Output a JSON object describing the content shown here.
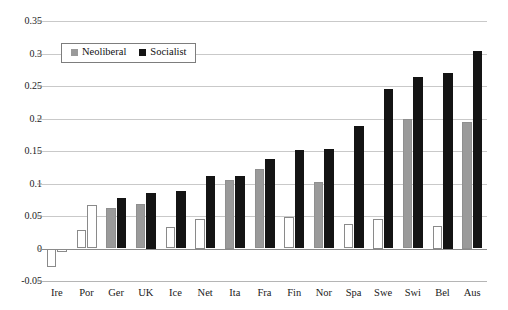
{
  "chart_data": {
    "type": "bar",
    "title": "",
    "xlabel": "",
    "ylabel": "",
    "ylim": [
      -0.05,
      0.35
    ],
    "ytick_values": [
      0.35,
      0.3,
      0.25,
      0.2,
      0.15,
      0.1,
      0.05,
      0,
      -0.05
    ],
    "ytick_labels": [
      "0.35",
      "0.3",
      "0.25",
      "0.2",
      "0.15",
      "0.1",
      "0.05",
      "0",
      "-0.05"
    ],
    "grid": true,
    "legend_position": "upper-left-inside",
    "categories": [
      "Ire",
      "Por",
      "Ger",
      "UK",
      "Ice",
      "Net",
      "Ita",
      "Fra",
      "Fin",
      "Nor",
      "Spa",
      "Swe",
      "Swi",
      "Bel",
      "Aus"
    ],
    "series": [
      {
        "name": "Neoliberal",
        "color": "#9a9a9a",
        "values": [
          -0.028,
          0.028,
          0.062,
          0.068,
          0.033,
          0.045,
          0.105,
          0.122,
          0.049,
          0.102,
          0.037,
          0.045,
          0.199,
          0.035,
          0.195
        ],
        "fill_styles": [
          "open",
          "open",
          "filled",
          "filled",
          "open",
          "open",
          "filled",
          "filled",
          "open",
          "filled",
          "open",
          "open",
          "filled",
          "open",
          "filled"
        ]
      },
      {
        "name": "Socialist",
        "color": "#141414",
        "values": [
          -0.005,
          0.067,
          0.078,
          0.085,
          0.089,
          0.111,
          0.111,
          0.137,
          0.152,
          0.153,
          0.188,
          0.246,
          0.264,
          0.27,
          0.304
        ],
        "fill_styles": [
          "open",
          "open",
          "filled",
          "filled",
          "filled",
          "filled",
          "filled",
          "filled",
          "filled",
          "filled",
          "filled",
          "filled",
          "filled",
          "filled",
          "filled"
        ]
      }
    ]
  },
  "legend": {
    "entries": [
      {
        "label": "Neoliberal",
        "swatch": "neoliberal"
      },
      {
        "label": "Socialist",
        "swatch": "socialist"
      }
    ]
  }
}
